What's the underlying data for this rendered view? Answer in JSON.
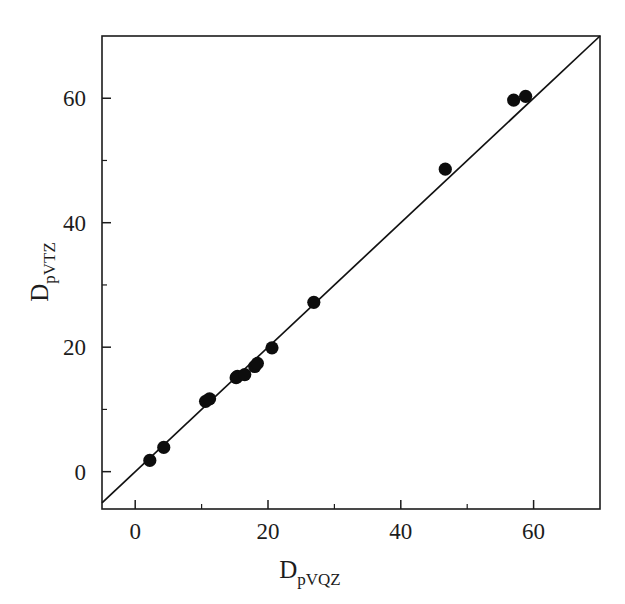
{
  "chart_data": {
    "type": "scatter",
    "title": "",
    "xlabel": "D_pVQZ",
    "ylabel": "D_pVTZ",
    "xlabel_base": "D",
    "xlabel_subscript": "pVQZ",
    "ylabel_base": "D",
    "ylabel_subscript": "pVTZ",
    "xlim": [
      -5,
      70
    ],
    "ylim": [
      -6,
      70
    ],
    "xticks": [
      0,
      20,
      40,
      60
    ],
    "yticks": [
      0,
      20,
      40,
      60
    ],
    "xticklabels": [
      "0",
      "20",
      "40",
      "60"
    ],
    "yticklabels": [
      "0",
      "20",
      "40",
      "60"
    ],
    "xminorticks": [
      10,
      30,
      50
    ],
    "yminorticks": [
      10,
      30,
      50
    ],
    "grid": false,
    "legend": null,
    "marker": "filled-circle",
    "marker_color": "#0d0d0d",
    "marker_size": 7,
    "reference_line": {
      "name": "identity-line",
      "type": "y=x",
      "slope": 1,
      "intercept": 0,
      "color": "#111111",
      "from": [
        -5,
        -5
      ],
      "to": [
        70,
        70
      ]
    },
    "points": [
      {
        "x": 2.2,
        "y": 1.8
      },
      {
        "x": 4.3,
        "y": 3.9
      },
      {
        "x": 10.6,
        "y": 11.3
      },
      {
        "x": 11.2,
        "y": 11.7
      },
      {
        "x": 15.2,
        "y": 15.1
      },
      {
        "x": 15.4,
        "y": 15.3
      },
      {
        "x": 16.5,
        "y": 15.6
      },
      {
        "x": 18.0,
        "y": 16.9
      },
      {
        "x": 18.4,
        "y": 17.4
      },
      {
        "x": 20.6,
        "y": 19.9
      },
      {
        "x": 26.9,
        "y": 27.2
      },
      {
        "x": 46.7,
        "y": 48.6
      },
      {
        "x": 57.0,
        "y": 59.7
      },
      {
        "x": 58.8,
        "y": 60.3
      }
    ]
  },
  "figure": {
    "background_color": "#ffffff",
    "frame_color": "#1c1c1c"
  }
}
